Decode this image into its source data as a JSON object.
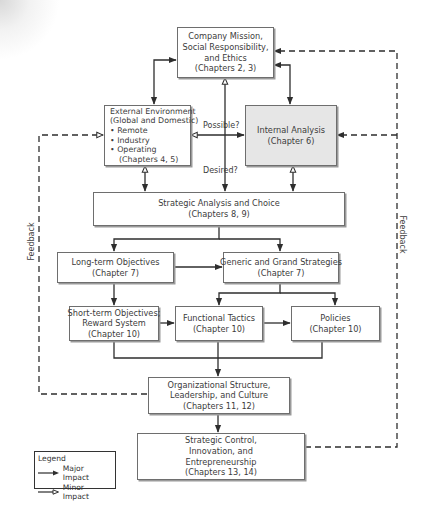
{
  "diagram": {
    "nodes": {
      "mission": {
        "lines": [
          "Company Mission,",
          "Social Responsibility,",
          "and Ethics",
          "(Chapters 2, 3)"
        ]
      },
      "external": {
        "lines": [
          "External Environment",
          "(Global and Domestic)",
          "• Remote",
          "• Industry",
          "• Operating",
          "   (Chapters 4, 5)"
        ]
      },
      "internal": {
        "lines": [
          "Internal Analysis",
          "(Chapter 6)"
        ]
      },
      "strategic_analysis": {
        "lines": [
          "Strategic Analysis and Choice",
          "(Chapters 8, 9)"
        ]
      },
      "long_term": {
        "lines": [
          "Long-term Objectives",
          "(Chapter 7)"
        ]
      },
      "generic": {
        "lines": [
          "Generic and Grand Strategies",
          "(Chapter 7)"
        ]
      },
      "short_term": {
        "lines": [
          "Short-term Objectives;",
          "Reward System",
          "(Chapter 10)"
        ]
      },
      "functional": {
        "lines": [
          "Functional Tactics",
          "(Chapter 10)"
        ]
      },
      "policies": {
        "lines": [
          "Policies",
          "(Chapter 10)"
        ]
      },
      "org": {
        "lines": [
          "Organizational Structure,",
          "Leadership, and Culture",
          "(Chapters 11, 12)"
        ]
      },
      "control": {
        "lines": [
          "Strategic Control,",
          "Innovation, and",
          "Entrepreneurship",
          "(Chapters 13, 14)"
        ]
      }
    },
    "edge_labels": {
      "possible": "Possible?",
      "desired": "Desired?",
      "feedback_left": "Feedback",
      "feedback_right": "Feedback"
    },
    "legend": {
      "title": "Legend",
      "major": "Major Impact",
      "minor": "Minor Impact"
    },
    "colors": {
      "line": "#2e2e2e",
      "box_border": "#6e6e6e",
      "shaded_fill": "#e6e6e6"
    }
  }
}
